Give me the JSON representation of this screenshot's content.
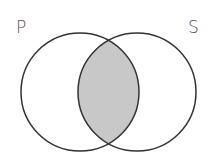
{
  "diagram": {
    "type": "venn",
    "sets": [
      {
        "label": "P",
        "cx": 80,
        "cy": 92,
        "r": 59
      },
      {
        "label": "S",
        "cx": 137,
        "cy": 92,
        "r": 59
      }
    ],
    "shaded_region": "intersection",
    "colors": {
      "stroke": "#333333",
      "shade": "#c8c8c8",
      "label": "#555555",
      "background": "#ffffff"
    }
  }
}
